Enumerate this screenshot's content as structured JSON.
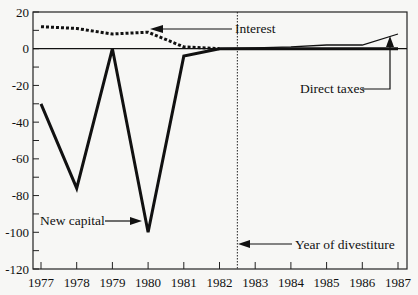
{
  "chart_data": {
    "type": "line",
    "title": "",
    "xlabel": "",
    "ylabel": "",
    "x": [
      1977,
      1978,
      1979,
      1980,
      1981,
      1982,
      1983,
      1984,
      1985,
      1986,
      1987
    ],
    "series": [
      {
        "name": "New capital",
        "style": "solid-thick",
        "values": [
          -30,
          -76,
          0,
          -100,
          -4,
          0,
          0,
          0,
          0,
          0,
          0
        ]
      },
      {
        "name": "Interest",
        "style": "dotted",
        "values": [
          12,
          11,
          8,
          9,
          1,
          0,
          null,
          null,
          null,
          null,
          null
        ]
      },
      {
        "name": "Direct taxes",
        "style": "solid-thin",
        "values": [
          null,
          null,
          null,
          null,
          null,
          0,
          0.5,
          1,
          2,
          2,
          8
        ]
      }
    ],
    "ylim": [
      -120,
      20
    ],
    "xlim": [
      1977,
      1987
    ],
    "y_ticks": [
      20,
      0,
      -20,
      -40,
      -60,
      -80,
      -100,
      -120
    ],
    "x_ticks": [
      "1977",
      "1978",
      "1979",
      "1980",
      "1981",
      "1982",
      "1983",
      "1984",
      "1985",
      "1986",
      "1987"
    ],
    "vertical_marker": {
      "x": 1982.5,
      "style": "dotted",
      "label": "Year of divestiture"
    },
    "annotations": [
      {
        "text": "Interest",
        "points_to": "Interest series near 1980"
      },
      {
        "text": "New capital",
        "points_to": "New capital minimum at 1980"
      },
      {
        "text": "Direct taxes",
        "points_to": "Direct taxes at 1987"
      },
      {
        "text": "Year of divestiture",
        "points_to": "vertical dotted line at 1982.5"
      }
    ],
    "grid": false,
    "legend": "none (inline annotations)"
  },
  "labels": {
    "y_ticks": [
      "20",
      "0",
      "-20",
      "-40",
      "-60",
      "-80",
      "-100",
      "-120"
    ],
    "x_ticks": [
      "1977",
      "1978",
      "1979",
      "1980",
      "1981",
      "1982",
      "1983",
      "1984",
      "1985",
      "1986",
      "1987"
    ],
    "interest": "Interest",
    "new_capital": "New capital",
    "direct_taxes": "Direct taxes",
    "divestiture": "Year of divestiture"
  },
  "colors": {
    "line": "#111111",
    "background": "#f7f7f5"
  }
}
